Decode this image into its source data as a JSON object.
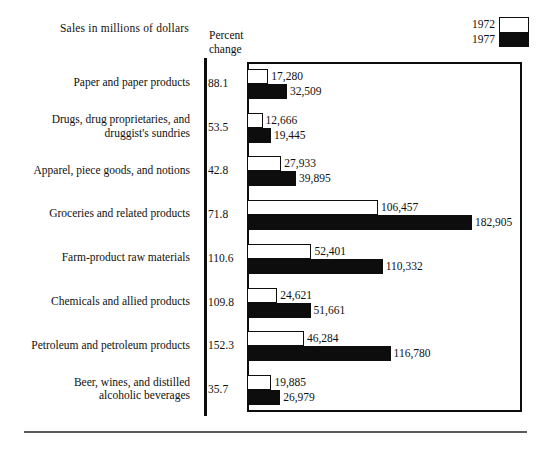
{
  "figure": {
    "title": "Sales in millions of dollars",
    "axis_caption_line1": "Percent",
    "axis_caption_line2": "change"
  },
  "legend": {
    "entries": [
      {
        "label": "1972",
        "swatch": "white-box",
        "color": "#ffffff"
      },
      {
        "label": "1977",
        "swatch": "black-box",
        "color": "#0d0d0d"
      }
    ],
    "entry_0_label": "1972",
    "entry_1_label": "1977"
  },
  "columns": {
    "category_header": "",
    "percent_header": "Percent change"
  },
  "chart_data": {
    "type": "bar",
    "orientation": "horizontal",
    "title": "Sales in millions of dollars",
    "xlabel": "",
    "ylabel": "",
    "xlim": [
      0,
      223600
    ],
    "grid": false,
    "legend_position": "top-right",
    "value_format": "comma-separated integers (millions of dollars)",
    "categories": [
      "Paper and paper products",
      "Drugs, drug proprietaries, and druggist's sundries",
      "Apparel, piece goods, and notions",
      "Groceries and related products",
      "Farm-product raw materials",
      "Chemicals and allied products",
      "Petroleum and petroleum products",
      "Beer, wines, and distilled alcoholic beverages"
    ],
    "category_lines": [
      [
        "Paper and paper products"
      ],
      [
        "Drugs, drug proprietaries, and",
        "druggist's sundries"
      ],
      [
        "Apparel, piece goods, and notions"
      ],
      [
        "Groceries and related products"
      ],
      [
        "Farm-product raw materials"
      ],
      [
        "Chemicals and allied products"
      ],
      [
        "Petroleum and petroleum products"
      ],
      [
        "Beer, wines, and distilled",
        "alcoholic beverages"
      ]
    ],
    "series": [
      {
        "name": "1972",
        "values": [
          17280,
          12666,
          27933,
          106457,
          52401,
          24621,
          46284,
          19885
        ],
        "labels": [
          "17,280",
          "12,666",
          "27,933",
          "106,457",
          "52,401",
          "24,621",
          "46,284",
          "19,885"
        ]
      },
      {
        "name": "1977",
        "values": [
          32509,
          19445,
          39895,
          182905,
          110332,
          51661,
          116780,
          26979
        ],
        "labels": [
          "32,509",
          "19,445",
          "39,895",
          "182,905",
          "110,332",
          "51,661",
          "116,780",
          "26,979"
        ]
      }
    ],
    "percent_change": [
      88.1,
      53.5,
      42.8,
      71.8,
      110.6,
      109.8,
      152.3,
      35.7
    ],
    "percent_change_labels": [
      "88.1",
      "53.5",
      "42.8",
      "71.8",
      "110.6",
      "109.8",
      "152.3",
      "35.7"
    ]
  }
}
